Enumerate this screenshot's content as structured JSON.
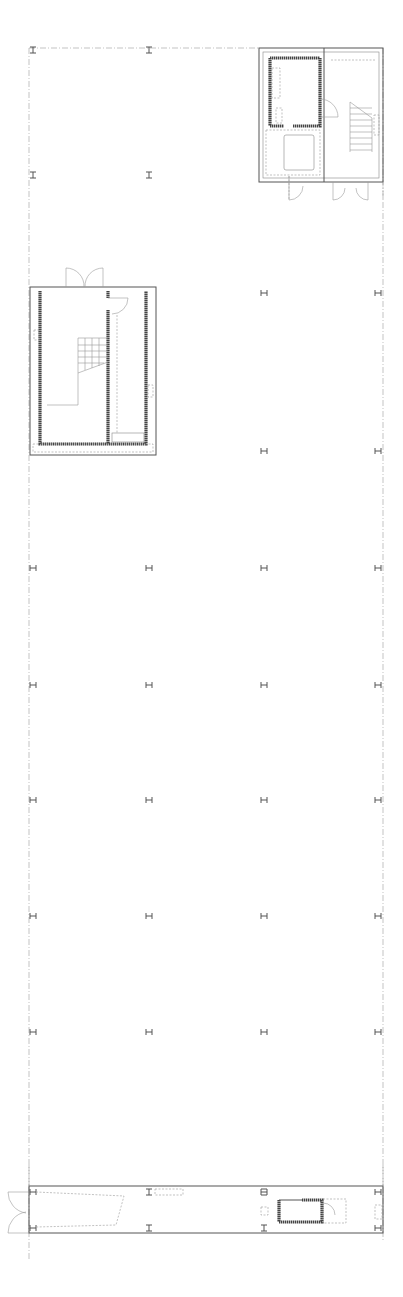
{
  "drawing": {
    "type": "architectural floor plan",
    "colors": {
      "line": "#555555",
      "grid": "#9a9a9a",
      "wall": "#444444",
      "background": "#ffffff"
    }
  },
  "grid": {
    "outline": {
      "x": 29,
      "y": 48,
      "width": 354,
      "height": 1200
    },
    "columns_x": [
      33,
      149,
      264,
      378
    ],
    "rows_y": [
      50,
      175,
      293,
      451,
      568,
      685,
      800,
      916,
      1032
    ],
    "bottom_rows_y": [
      1191,
      1252
    ]
  },
  "column_markers": [
    {
      "x": 33,
      "y": 50,
      "orient": "I"
    },
    {
      "x": 149,
      "y": 50,
      "orient": "I"
    },
    {
      "x": 33,
      "y": 175,
      "orient": "I"
    },
    {
      "x": 149,
      "y": 175,
      "orient": "I"
    },
    {
      "x": 264,
      "y": 293,
      "orient": "H"
    },
    {
      "x": 378,
      "y": 293,
      "orient": "H"
    },
    {
      "x": 264,
      "y": 451,
      "orient": "H"
    },
    {
      "x": 378,
      "y": 451,
      "orient": "H"
    },
    {
      "x": 33,
      "y": 568,
      "orient": "H"
    },
    {
      "x": 149,
      "y": 568,
      "orient": "H"
    },
    {
      "x": 264,
      "y": 568,
      "orient": "H"
    },
    {
      "x": 378,
      "y": 568,
      "orient": "H"
    },
    {
      "x": 33,
      "y": 685,
      "orient": "H"
    },
    {
      "x": 149,
      "y": 685,
      "orient": "H"
    },
    {
      "x": 264,
      "y": 685,
      "orient": "H"
    },
    {
      "x": 378,
      "y": 685,
      "orient": "H"
    },
    {
      "x": 33,
      "y": 800,
      "orient": "H"
    },
    {
      "x": 149,
      "y": 800,
      "orient": "H"
    },
    {
      "x": 264,
      "y": 800,
      "orient": "H"
    },
    {
      "x": 378,
      "y": 800,
      "orient": "H"
    },
    {
      "x": 33,
      "y": 916,
      "orient": "H"
    },
    {
      "x": 149,
      "y": 916,
      "orient": "H"
    },
    {
      "x": 264,
      "y": 916,
      "orient": "H"
    },
    {
      "x": 378,
      "y": 916,
      "orient": "H"
    },
    {
      "x": 33,
      "y": 1032,
      "orient": "H"
    },
    {
      "x": 149,
      "y": 1032,
      "orient": "H"
    },
    {
      "x": 264,
      "y": 1032,
      "orient": "H"
    },
    {
      "x": 378,
      "y": 1032,
      "orient": "H"
    },
    {
      "x": 33,
      "y": 1192,
      "orient": "H"
    },
    {
      "x": 149,
      "y": 1192,
      "orient": "I"
    },
    {
      "x": 264,
      "y": 1192,
      "orient": "B"
    },
    {
      "x": 378,
      "y": 1192,
      "orient": "H"
    },
    {
      "x": 33,
      "y": 1228,
      "orient": "H"
    },
    {
      "x": 149,
      "y": 1228,
      "orient": "I"
    },
    {
      "x": 264,
      "y": 1228,
      "orient": "I"
    },
    {
      "x": 378,
      "y": 1228,
      "orient": "H"
    }
  ],
  "core_top_right": {
    "x": 259,
    "y": 48,
    "width": 124,
    "height": 134,
    "divider_x": 324
  },
  "core_left": {
    "x": 30,
    "y": 287,
    "width": 126,
    "height": 168
  },
  "bottom_strip": {
    "x": 29,
    "y": 1186,
    "width": 354,
    "height": 47
  }
}
